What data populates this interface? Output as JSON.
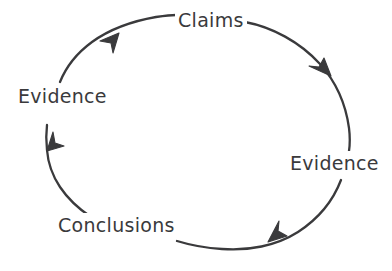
{
  "diagram": {
    "type": "cycle",
    "direction": "clockwise",
    "stroke_color": "#3a3a3c",
    "background_color": "#ffffff",
    "nodes": [
      {
        "id": "claims",
        "label": "Claims",
        "position": "top"
      },
      {
        "id": "evidence-right",
        "label": "Evidence",
        "position": "right"
      },
      {
        "id": "conclusions",
        "label": "Conclusions",
        "position": "bottom"
      },
      {
        "id": "evidence-left",
        "label": "Evidence",
        "position": "left"
      }
    ],
    "arrows": [
      {
        "id": "arrow-top-right",
        "from": "claims",
        "to": "evidence-right",
        "icon": "arrowhead-icon"
      },
      {
        "id": "arrow-bottom-right",
        "from": "evidence-right",
        "to": "conclusions",
        "icon": "arrowhead-icon"
      },
      {
        "id": "arrow-bottom-left",
        "from": "conclusions",
        "to": "evidence-left",
        "icon": "arrowhead-icon"
      },
      {
        "id": "arrow-top-left",
        "from": "evidence-left",
        "to": "claims",
        "icon": "arrowhead-icon"
      }
    ]
  }
}
